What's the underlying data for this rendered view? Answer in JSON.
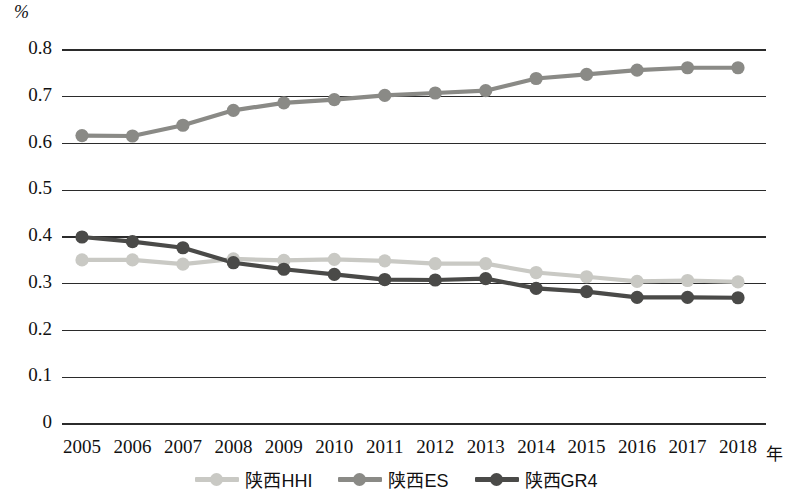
{
  "chart_data": {
    "type": "line",
    "title": "",
    "subtitle": "",
    "xlabel": "年",
    "ylabel": "%",
    "x": [
      2005,
      2006,
      2007,
      2008,
      2009,
      2010,
      2011,
      2012,
      2013,
      2014,
      2015,
      2016,
      2017,
      2018
    ],
    "categories": [
      "2005",
      "2006",
      "2007",
      "2008",
      "2009",
      "2010",
      "2011",
      "2012",
      "2013",
      "2014",
      "2015",
      "2016",
      "2017",
      "2018"
    ],
    "ylim": [
      0,
      0.8
    ],
    "yticks": [
      0,
      0.1,
      0.2,
      0.3,
      0.4,
      0.5,
      0.6,
      0.7,
      0.8
    ],
    "ytick_labels": [
      "0",
      "0.1",
      "0.2",
      "0.3",
      "0.4",
      "0.5",
      "0.6",
      "0.7",
      "0.8"
    ],
    "grid": true,
    "grid_axis": "y",
    "legend_position": "bottom",
    "series": [
      {
        "name": "陕西HHI",
        "color": "#c9c9c4",
        "values": [
          0.351,
          0.351,
          0.342,
          0.353,
          0.35,
          0.352,
          0.349,
          0.343,
          0.343,
          0.324,
          0.315,
          0.305,
          0.307,
          0.304
        ]
      },
      {
        "name": "陕西ES",
        "color": "#8a8a86",
        "values": [
          0.617,
          0.616,
          0.639,
          0.671,
          0.687,
          0.694,
          0.703,
          0.708,
          0.713,
          0.739,
          0.748,
          0.757,
          0.762,
          0.762
        ]
      },
      {
        "name": "陕西GR4",
        "color": "#4a4a48",
        "values": [
          0.4,
          0.39,
          0.377,
          0.345,
          0.331,
          0.32,
          0.309,
          0.308,
          0.311,
          0.29,
          0.283,
          0.271,
          0.271,
          0.27
        ]
      }
    ]
  },
  "axes": {
    "y_unit_label": "%",
    "x_unit_label": "年"
  },
  "legend": {
    "items": [
      {
        "label": "陕西HHI",
        "color": "#c9c9c4"
      },
      {
        "label": "陕西ES",
        "color": "#8a8a86"
      },
      {
        "label": "陕西GR4",
        "color": "#4a4a48"
      }
    ]
  },
  "plot_geometry": {
    "left": 62,
    "right": 766,
    "top": 50,
    "bottom": 424,
    "point_first_x": 82,
    "point_last_x": 738
  }
}
